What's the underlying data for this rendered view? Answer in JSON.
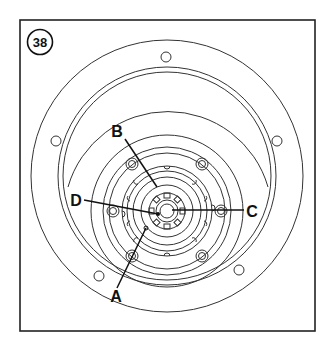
{
  "figure": {
    "step_number": "38",
    "colors": {
      "line": "#333333",
      "frame": "#222222",
      "background": "#ffffff"
    }
  },
  "callouts": [
    {
      "id": "A",
      "label": "A"
    },
    {
      "id": "B",
      "label": "B"
    },
    {
      "id": "C",
      "label": "C"
    },
    {
      "id": "D",
      "label": "D"
    }
  ]
}
